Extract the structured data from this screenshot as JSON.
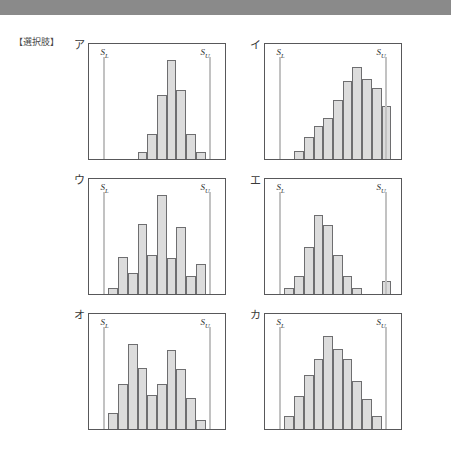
{
  "page": {
    "choices_label": "【選択肢】",
    "banner_color": "#8a8a8a",
    "background_color": "#ffffff",
    "bar_fill_color": "#dcdcdc",
    "bar_stroke_color": "#6e6e70",
    "spec_line_color": "#c2c2c2",
    "panel_border_color": "#58585a"
  },
  "labels": {
    "lower_spec": "S",
    "lower_spec_sub": "L",
    "upper_spec": "S",
    "upper_spec_sub": "U"
  },
  "chart_data": [
    {
      "type": "bar",
      "title": "ア",
      "xlabel": "",
      "ylabel": "",
      "ylim": [
        0,
        10
      ],
      "grid": false,
      "legend": "none",
      "bins": 14,
      "lower_spec_limit_bin": 1.5,
      "upper_spec_limit_bin": 12.5,
      "annotations": [
        "S_L",
        "S_U"
      ],
      "values": [
        0,
        0,
        0,
        0,
        0,
        0.6,
        2.2,
        5.6,
        8.6,
        6.0,
        2.2,
        0.6,
        0,
        0
      ],
      "description": "narrow centered distribution well within spec limits"
    },
    {
      "type": "bar",
      "title": "イ",
      "xlabel": "",
      "ylabel": "",
      "ylim": [
        0,
        10
      ],
      "grid": false,
      "legend": "none",
      "bins": 14,
      "lower_spec_limit_bin": 1.5,
      "upper_spec_limit_bin": 12.5,
      "annotations": [
        "S_L",
        "S_U"
      ],
      "values": [
        0,
        0,
        0,
        0.7,
        1.9,
        2.9,
        3.6,
        5.1,
        6.8,
        8.0,
        7.0,
        6.2,
        4.6,
        0
      ],
      "description": "distribution shifted toward upper spec limit"
    },
    {
      "type": "bar",
      "title": "ウ",
      "xlabel": "",
      "ylabel": "",
      "ylim": [
        0,
        10
      ],
      "grid": false,
      "legend": "none",
      "bins": 14,
      "lower_spec_limit_bin": 1.5,
      "upper_spec_limit_bin": 12.5,
      "annotations": [
        "S_L",
        "S_U"
      ],
      "values": [
        0,
        0,
        0.5,
        3.2,
        1.8,
        6.1,
        3.4,
        8.6,
        3.1,
        5.8,
        1.6,
        2.6,
        0,
        0
      ],
      "description": "irregular jagged comb-like distribution"
    },
    {
      "type": "bar",
      "title": "エ",
      "xlabel": "",
      "ylabel": "",
      "ylim": [
        0,
        10
      ],
      "grid": false,
      "legend": "none",
      "bins": 14,
      "lower_spec_limit_bin": 1.5,
      "upper_spec_limit_bin": 12.5,
      "annotations": [
        "S_L",
        "S_U"
      ],
      "values": [
        0,
        0,
        0.5,
        1.6,
        4.1,
        6.9,
        6.0,
        3.4,
        1.6,
        0.5,
        0,
        0,
        1.1,
        0
      ],
      "description": "centered distribution with isolated outlier bar near upper spec limit"
    },
    {
      "type": "bar",
      "title": "オ",
      "xlabel": "",
      "ylabel": "",
      "ylim": [
        0,
        10
      ],
      "grid": false,
      "legend": "none",
      "bins": 14,
      "lower_spec_limit_bin": 1.5,
      "upper_spec_limit_bin": 12.5,
      "annotations": [
        "S_L",
        "S_U"
      ],
      "values": [
        0,
        0,
        1.4,
        3.9,
        7.4,
        5.3,
        3.0,
        3.9,
        6.9,
        5.2,
        2.7,
        0.8,
        0,
        0
      ],
      "description": "bimodal twin-peaked distribution"
    },
    {
      "type": "bar",
      "title": "カ",
      "xlabel": "",
      "ylabel": "",
      "ylim": [
        0,
        10
      ],
      "grid": false,
      "legend": "none",
      "bins": 14,
      "lower_spec_limit_bin": 1.5,
      "upper_spec_limit_bin": 12.5,
      "annotations": [
        "S_L",
        "S_U"
      ],
      "values": [
        0,
        0,
        1.1,
        2.9,
        4.7,
        6.1,
        8.1,
        7.0,
        6.1,
        4.2,
        2.6,
        1.1,
        0,
        0
      ],
      "description": "smooth symmetric bell-shaped distribution centered between spec limits"
    }
  ]
}
